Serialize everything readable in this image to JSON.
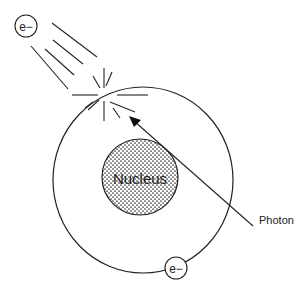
{
  "diagram": {
    "labels": {
      "nucleus": "Nucleus",
      "photon": "Photon",
      "ejected_electron": "e−",
      "orbital_electron": "e−"
    },
    "colors": {
      "stroke": "#222222",
      "background": "#ffffff",
      "nucleus_dots": "#333333"
    }
  }
}
